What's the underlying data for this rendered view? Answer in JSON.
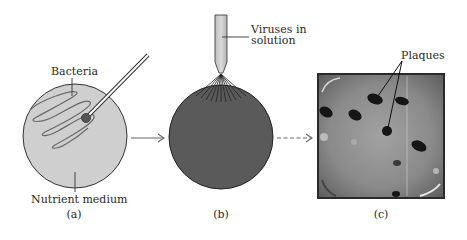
{
  "figure": {
    "panels": [
      {
        "id": "a",
        "caption": "(a)",
        "labels": {
          "top": "Bacteria",
          "bottom": "Nutrient medium"
        },
        "dish_color": "#cfcfcf",
        "inoculating_loop_color": "#555555"
      },
      {
        "id": "b",
        "caption": "(b)",
        "labels": {
          "pipette_line1": "Viruses in",
          "pipette_line2": "solution"
        },
        "dish_color": "#5a5a5a"
      },
      {
        "id": "c",
        "caption": "(c)",
        "labels": {
          "plaques": "Plaques"
        },
        "photo_background": "#8a8a8a"
      }
    ],
    "arrows": [
      {
        "from": "a",
        "to": "b",
        "style": "solid"
      },
      {
        "from": "b",
        "to": "c",
        "style": "dashed"
      }
    ]
  }
}
